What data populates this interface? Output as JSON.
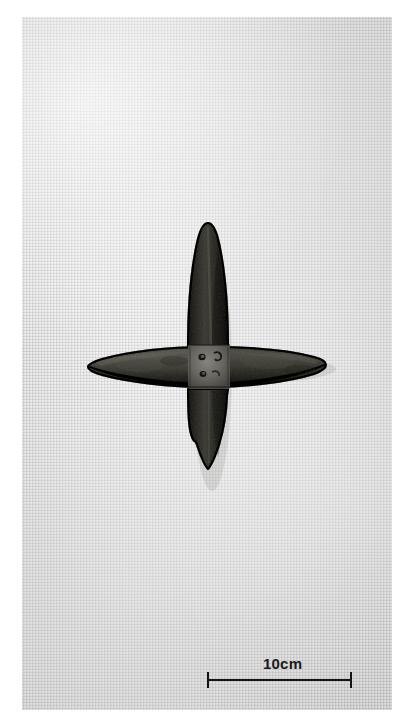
{
  "figure": {
    "kind": "archaeological-object-photograph",
    "caption_text": "",
    "plate_background": "#ededed",
    "page_background": "#ffffff"
  },
  "scale_bar": {
    "label": "10cm",
    "value": 10,
    "unit": "cm",
    "bar_color": "#141414",
    "bar_length_px": 145,
    "tick_count": 2
  },
  "artifact": {
    "name": "cross-shaped-iron-object",
    "description": "Four lance-shaped blades forming an equal-armed cross",
    "body_color": "#6e6d69",
    "edge_color": "#1e1d1b",
    "highlight_color": "#9a9892",
    "shadow_color": "#35342f",
    "arms": [
      {
        "name": "upper-arm",
        "orientation": "vertical",
        "direction": "up"
      },
      {
        "name": "lower-arm",
        "orientation": "vertical",
        "direction": "down"
      },
      {
        "name": "left-arm",
        "orientation": "horizontal",
        "direction": "left"
      },
      {
        "name": "right-arm",
        "orientation": "horizontal",
        "direction": "right"
      }
    ],
    "center_features": [
      {
        "name": "rivet-hole-upper"
      },
      {
        "name": "rivet-hole-lower"
      }
    ]
  }
}
